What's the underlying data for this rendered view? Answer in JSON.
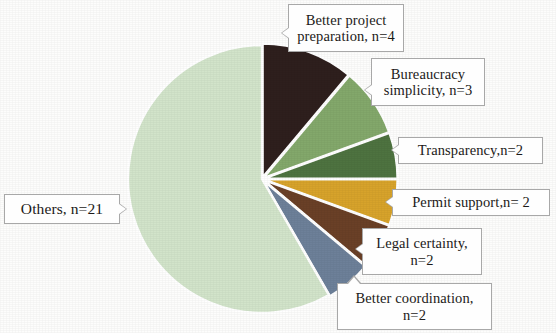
{
  "chart_data": {
    "type": "pie",
    "title": "",
    "subtitle": "",
    "xlabel": "",
    "ylabel": "",
    "legend_position": "callout-labels",
    "grid": false,
    "total": 36,
    "value_key": "n",
    "categories": [
      "Better project preparation",
      "Bureaucracy simplicity",
      "Transparency",
      "Permit support",
      "Legal certainty",
      "Better coordination",
      "Others"
    ],
    "values": [
      4,
      3,
      2,
      2,
      2,
      2,
      21
    ],
    "colors": [
      "#2e1f1d",
      "#83a86b",
      "#4e7340",
      "#d7a32b",
      "#6a4027",
      "#6d8099",
      "#d2e4ca"
    ],
    "start_angle_deg": 0,
    "direction": "clockwise",
    "slices": [
      {
        "label_text": "Better project\npreparation, n=4",
        "name": "Better project preparation",
        "n": 4,
        "color": "#2e1f1d"
      },
      {
        "label_text": "Bureaucracy\nsimplicity, n=3",
        "name": "Bureaucracy simplicity",
        "n": 3,
        "color": "#83a86b"
      },
      {
        "label_text": "Transparency,n=2",
        "name": "Transparency",
        "n": 2,
        "color": "#4e7340"
      },
      {
        "label_text": "Permit support,n= 2",
        "name": "Permit support",
        "n": 2,
        "color": "#d7a32b"
      },
      {
        "label_text": "Legal certainty,\nn=2",
        "name": "Legal certainty",
        "n": 2,
        "color": "#6a4027"
      },
      {
        "label_text": "Better coordination,\nn=2",
        "name": "Better coordination",
        "n": 2,
        "color": "#6d8099"
      },
      {
        "label_text": "Others, n=21",
        "name": "Others",
        "n": 21,
        "color": "#d2e4ca"
      }
    ]
  },
  "labels": {
    "better_project": "Better project\npreparation, n=4",
    "bureaucracy": "Bureaucracy\nsimplicity, n=3",
    "transparency": "Transparency,n=2",
    "permit_support": "Permit support,n= 2",
    "legal_certainty": "Legal certainty,\nn=2",
    "better_coordination": "Better coordination,\nn=2",
    "others": "Others, n=21"
  },
  "colors": {
    "slice_better_project": "#2e1f1d",
    "slice_bureaucracy": "#83a86b",
    "slice_transparency": "#4e7340",
    "slice_permit_support": "#d7a32b",
    "slice_legal_certainty": "#6a4027",
    "slice_better_coordination": "#6d8099",
    "slice_others": "#d2e4ca",
    "separator": "#ffffff",
    "callout_border": "#a8a8a8",
    "callout_background": "#fefefe",
    "text": "#1c1a18",
    "page_background": "#fdfdfc"
  },
  "geometry": {
    "center_x": 262,
    "center_y": 179,
    "radius": 134
  }
}
